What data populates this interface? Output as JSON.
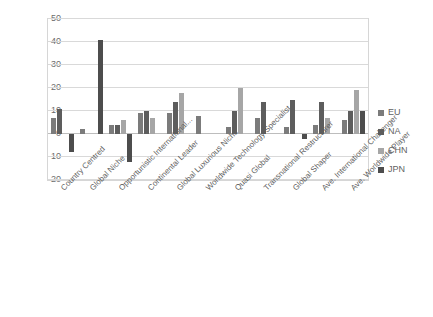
{
  "chart_data": {
    "type": "bar",
    "title": "",
    "subtitle": "",
    "xlabel": "",
    "ylabel": "",
    "ylim": [
      -20,
      50
    ],
    "yticks": [
      50,
      40,
      30,
      20,
      10,
      0,
      -10,
      -20
    ],
    "grid": true,
    "legend_position": "right",
    "categories": [
      "Country Centred",
      "Global Niche",
      "Opportunistic International...",
      "Continental Leader",
      "Global Luxurious Niche",
      "Worldwide Technology Specialist",
      "Quasi Global",
      "Transnational Restructurer",
      "Global Shaper",
      "Ave. International Challenger",
      "Ave. Worldwide Player"
    ],
    "series": [
      {
        "name": "EU",
        "color": "#7b7b7b",
        "values": [
          7,
          2,
          4,
          9,
          9,
          8,
          3,
          7,
          3,
          4,
          6
        ]
      },
      {
        "name": "NA",
        "color": "#5d5d5d",
        "values": [
          11,
          0,
          4,
          10,
          14,
          0,
          10,
          14,
          15,
          14,
          10
        ]
      },
      {
        "name": "CHN",
        "color": "#a6a6a6",
        "values": [
          0,
          0,
          6,
          7,
          18,
          0,
          20,
          0,
          0,
          7,
          19
        ]
      },
      {
        "name": "JPN",
        "color": "#4d4d4d",
        "values": [
          -8,
          41,
          -12,
          0,
          0,
          0,
          0,
          0,
          -2,
          0,
          10
        ]
      }
    ]
  },
  "legend": {
    "items": [
      {
        "label": "EU",
        "color": "#7b7b7b"
      },
      {
        "label": "NA",
        "color": "#5d5d5d"
      },
      {
        "label": "CHN",
        "color": "#a6a6a6"
      },
      {
        "label": "JPN",
        "color": "#4d4d4d"
      }
    ]
  }
}
